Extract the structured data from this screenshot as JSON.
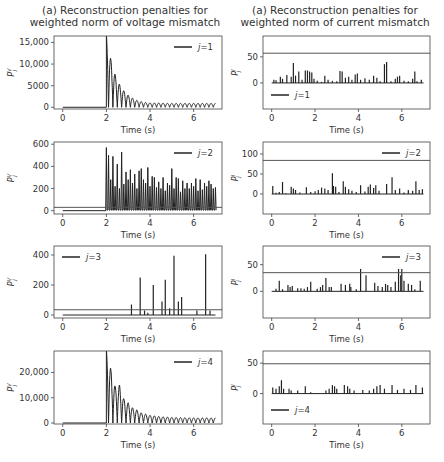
{
  "columns": [
    {
      "title_line1": "(a) Reconstruction penalties for",
      "title_line2": "weighted norm of voltage mismatch"
    },
    {
      "title_line1": "(a) Reconstruction penalties for",
      "title_line2": "weighted norm of current mismatch"
    }
  ],
  "chart_data": [
    {
      "type": "line",
      "panel": "voltage j=1",
      "title": "(a) Reconstruction penalties for weighted norm of voltage mismatch",
      "xlabel": "Time (s)",
      "ylabel": "P^V_j",
      "legend": "j=1",
      "legend_position": "upper right",
      "xlim": [
        -0.4,
        7.3
      ],
      "ylim": [
        -400,
        16500
      ],
      "xticks": [
        0,
        2,
        4,
        6
      ],
      "yticks": [
        0,
        5000,
        10000,
        15000
      ],
      "ytick_labels": [
        "0",
        "5000",
        "10,000",
        "15,000"
      ],
      "threshold": null,
      "description": "zero until t=2, then damped oscillation",
      "envelope": [
        [
          2.0,
          16500
        ],
        [
          2.2,
          11200
        ],
        [
          2.4,
          7600
        ],
        [
          2.6,
          5300
        ],
        [
          2.8,
          3800
        ],
        [
          3.0,
          2800
        ],
        [
          3.2,
          2100
        ],
        [
          3.4,
          1600
        ],
        [
          3.6,
          1300
        ],
        [
          3.8,
          1100
        ],
        [
          4.0,
          1000
        ],
        [
          5.0,
          900
        ],
        [
          6.0,
          900
        ],
        [
          7.0,
          900
        ]
      ]
    },
    {
      "type": "bar",
      "panel": "current j=1",
      "title": "(a) Reconstruction penalties for weighted norm of current mismatch",
      "xlabel": "Time (s)",
      "ylabel": "P^I_j",
      "legend": "j=1",
      "legend_position": "lower left",
      "xlim": [
        -0.4,
        7.3
      ],
      "ylim": [
        -50,
        90
      ],
      "xticks": [
        0,
        2,
        4,
        6
      ],
      "yticks": [
        0,
        50
      ],
      "ytick_labels": [
        "0",
        "50"
      ],
      "threshold": 57,
      "spikes": [
        [
          0.1,
          6
        ],
        [
          0.2,
          5
        ],
        [
          0.4,
          12
        ],
        [
          0.5,
          8
        ],
        [
          0.7,
          15
        ],
        [
          0.9,
          12
        ],
        [
          1.0,
          38
        ],
        [
          1.1,
          14
        ],
        [
          1.25,
          22
        ],
        [
          1.4,
          6
        ],
        [
          1.55,
          24
        ],
        [
          1.65,
          24
        ],
        [
          1.75,
          22
        ],
        [
          1.85,
          20
        ],
        [
          1.95,
          8
        ],
        [
          2.1,
          4
        ],
        [
          2.3,
          2
        ],
        [
          2.45,
          14
        ],
        [
          2.6,
          6
        ],
        [
          2.8,
          4
        ],
        [
          3.0,
          3
        ],
        [
          3.15,
          23
        ],
        [
          3.25,
          22
        ],
        [
          3.4,
          10
        ],
        [
          3.55,
          12
        ],
        [
          3.7,
          6
        ],
        [
          3.85,
          16
        ],
        [
          3.95,
          18
        ],
        [
          4.1,
          6
        ],
        [
          4.3,
          9
        ],
        [
          4.5,
          6
        ],
        [
          4.7,
          14
        ],
        [
          4.85,
          10
        ],
        [
          5.0,
          3
        ],
        [
          5.2,
          36
        ],
        [
          5.3,
          40
        ],
        [
          5.5,
          3
        ],
        [
          5.7,
          8
        ],
        [
          5.8,
          12
        ],
        [
          5.9,
          14
        ],
        [
          6.1,
          4
        ],
        [
          6.3,
          3
        ],
        [
          6.5,
          8
        ],
        [
          6.6,
          22
        ],
        [
          6.7,
          3
        ],
        [
          6.9,
          6
        ]
      ]
    },
    {
      "type": "line",
      "panel": "voltage j=2",
      "xlabel": "Time (s)",
      "ylabel": "P^V_j",
      "legend": "j=2",
      "legend_position": "upper right",
      "xlim": [
        -0.4,
        7.3
      ],
      "ylim": [
        -30,
        620
      ],
      "xticks": [
        0,
        2,
        4,
        6
      ],
      "yticks": [
        0,
        200,
        400,
        600
      ],
      "ytick_labels": [
        "0",
        "200",
        "400",
        "600"
      ],
      "threshold": 30,
      "peaks": [
        [
          2.0,
          570
        ],
        [
          2.1,
          500
        ],
        [
          2.2,
          280
        ],
        [
          2.3,
          490
        ],
        [
          2.4,
          220
        ],
        [
          2.5,
          420
        ],
        [
          2.6,
          200
        ],
        [
          2.7,
          530
        ],
        [
          2.8,
          240
        ],
        [
          2.9,
          350
        ],
        [
          3.0,
          280
        ],
        [
          3.1,
          370
        ],
        [
          3.2,
          250
        ],
        [
          3.3,
          330
        ],
        [
          3.4,
          200
        ],
        [
          3.5,
          360
        ],
        [
          3.6,
          380
        ],
        [
          3.7,
          280
        ],
        [
          3.8,
          250
        ],
        [
          3.9,
          390
        ],
        [
          4.0,
          220
        ],
        [
          4.1,
          310
        ],
        [
          4.2,
          300
        ],
        [
          4.3,
          210
        ],
        [
          4.4,
          260
        ],
        [
          4.5,
          200
        ],
        [
          4.6,
          300
        ],
        [
          4.7,
          180
        ],
        [
          4.8,
          250
        ],
        [
          4.9,
          230
        ],
        [
          5.0,
          380
        ],
        [
          5.1,
          200
        ],
        [
          5.2,
          300
        ],
        [
          5.3,
          290
        ],
        [
          5.4,
          170
        ],
        [
          5.5,
          270
        ],
        [
          5.6,
          200
        ],
        [
          5.7,
          250
        ],
        [
          5.8,
          200
        ],
        [
          5.9,
          250
        ],
        [
          6.0,
          220
        ],
        [
          6.1,
          290
        ],
        [
          6.2,
          180
        ],
        [
          6.3,
          280
        ],
        [
          6.4,
          190
        ],
        [
          6.5,
          250
        ],
        [
          6.6,
          220
        ],
        [
          6.7,
          270
        ],
        [
          6.8,
          240
        ],
        [
          6.9,
          200
        ],
        [
          7.0,
          210
        ]
      ]
    },
    {
      "type": "bar",
      "panel": "current j=2",
      "xlabel": "Time (s)",
      "ylabel": "P^I_j",
      "legend": "j=2",
      "legend_position": "upper right",
      "xlim": [
        -0.4,
        7.3
      ],
      "ylim": [
        -50,
        130
      ],
      "xticks": [
        0,
        2,
        4,
        6
      ],
      "yticks": [
        0,
        50,
        100
      ],
      "ytick_labels": [
        "0",
        "50",
        "100"
      ],
      "threshold": 84,
      "spikes": [
        [
          0.05,
          20
        ],
        [
          0.2,
          3
        ],
        [
          0.35,
          5
        ],
        [
          0.5,
          30
        ],
        [
          0.65,
          2
        ],
        [
          0.9,
          18
        ],
        [
          1.0,
          14
        ],
        [
          1.1,
          10
        ],
        [
          1.3,
          4
        ],
        [
          1.6,
          17
        ],
        [
          1.8,
          5
        ],
        [
          2.0,
          7
        ],
        [
          2.15,
          10
        ],
        [
          2.3,
          16
        ],
        [
          2.45,
          14
        ],
        [
          2.6,
          10
        ],
        [
          2.8,
          52
        ],
        [
          2.85,
          20
        ],
        [
          2.95,
          18
        ],
        [
          3.1,
          5
        ],
        [
          3.3,
          32
        ],
        [
          3.4,
          18
        ],
        [
          3.55,
          12
        ],
        [
          3.7,
          8
        ],
        [
          3.9,
          5
        ],
        [
          4.1,
          22
        ],
        [
          4.3,
          6
        ],
        [
          4.45,
          18
        ],
        [
          4.55,
          24
        ],
        [
          4.7,
          15
        ],
        [
          4.8,
          22
        ],
        [
          4.95,
          8
        ],
        [
          5.3,
          25
        ],
        [
          5.55,
          42
        ],
        [
          5.7,
          10
        ],
        [
          5.9,
          14
        ],
        [
          6.1,
          4
        ],
        [
          6.3,
          10
        ],
        [
          6.5,
          8
        ],
        [
          6.65,
          32
        ],
        [
          6.8,
          10
        ],
        [
          6.95,
          12
        ]
      ]
    },
    {
      "type": "bar",
      "panel": "voltage j=3",
      "xlabel": "Time (s)",
      "ylabel": "P^V_j",
      "legend": "j=3",
      "legend_position": "upper left",
      "xlim": [
        -0.4,
        7.3
      ],
      "ylim": [
        -20,
        460
      ],
      "xticks": [
        0,
        2,
        4,
        6
      ],
      "yticks": [
        0,
        200,
        400
      ],
      "ytick_labels": [
        "0",
        "200",
        "400"
      ],
      "threshold": 35,
      "spikes": [
        [
          3.15,
          70
        ],
        [
          3.55,
          250
        ],
        [
          3.75,
          30
        ],
        [
          3.9,
          15
        ],
        [
          4.15,
          200
        ],
        [
          4.55,
          90
        ],
        [
          4.7,
          235
        ],
        [
          4.9,
          45
        ],
        [
          5.1,
          395
        ],
        [
          5.3,
          90
        ],
        [
          5.45,
          120
        ],
        [
          6.15,
          30
        ],
        [
          6.55,
          405
        ],
        [
          6.75,
          30
        ]
      ]
    },
    {
      "type": "bar",
      "panel": "current j=3",
      "xlabel": "Time (s)",
      "ylabel": "P^I_j",
      "legend": "j=3",
      "legend_position": "upper right",
      "xlim": [
        -0.4,
        7.3
      ],
      "ylim": [
        -50,
        85
      ],
      "xticks": [
        0,
        2,
        4,
        6
      ],
      "yticks": [
        0,
        50
      ],
      "ytick_labels": [
        "0",
        "50"
      ],
      "threshold": 35,
      "spikes": [
        [
          0.2,
          5
        ],
        [
          0.35,
          20
        ],
        [
          0.5,
          4
        ],
        [
          0.75,
          12
        ],
        [
          0.85,
          8
        ],
        [
          0.95,
          10
        ],
        [
          1.2,
          6
        ],
        [
          1.35,
          6
        ],
        [
          1.5,
          5
        ],
        [
          1.65,
          8
        ],
        [
          1.8,
          18
        ],
        [
          2.1,
          5
        ],
        [
          2.25,
          8
        ],
        [
          2.35,
          12
        ],
        [
          2.5,
          25
        ],
        [
          2.65,
          8
        ],
        [
          2.75,
          8
        ],
        [
          3.2,
          14
        ],
        [
          3.4,
          12
        ],
        [
          3.6,
          14
        ],
        [
          3.65,
          8
        ],
        [
          3.9,
          4
        ],
        [
          4.1,
          42
        ],
        [
          4.35,
          30
        ],
        [
          4.75,
          16
        ],
        [
          4.9,
          10
        ],
        [
          5.1,
          8
        ],
        [
          5.25,
          14
        ],
        [
          5.35,
          12
        ],
        [
          5.5,
          8
        ],
        [
          5.7,
          18
        ],
        [
          5.85,
          42
        ],
        [
          5.95,
          30
        ],
        [
          6.0,
          42
        ],
        [
          6.1,
          20
        ],
        [
          6.3,
          14
        ],
        [
          6.45,
          12
        ],
        [
          6.6,
          4
        ],
        [
          6.85,
          20
        ]
      ]
    },
    {
      "type": "line",
      "panel": "voltage j=4",
      "xlabel": "Time (s)",
      "ylabel": "P^V_j",
      "legend": "j=4",
      "legend_position": "upper right",
      "xlim": [
        -0.4,
        7.3
      ],
      "ylim": [
        -400,
        28500
      ],
      "xticks": [
        0,
        2,
        4,
        6
      ],
      "yticks": [
        0,
        10000,
        20000
      ],
      "ytick_labels": [
        "0",
        "10,000",
        "20,000"
      ],
      "threshold": null,
      "description": "zero until t=2, then damped oscillation",
      "envelope": [
        [
          2.0,
          28500
        ],
        [
          2.1,
          26000
        ],
        [
          2.2,
          21500
        ],
        [
          2.4,
          14500
        ],
        [
          2.6,
          15000
        ],
        [
          2.8,
          9500
        ],
        [
          3.0,
          8000
        ],
        [
          3.2,
          6000
        ],
        [
          3.4,
          5200
        ],
        [
          3.6,
          4000
        ],
        [
          3.8,
          3500
        ],
        [
          4.0,
          3000
        ],
        [
          4.5,
          2500
        ],
        [
          5.0,
          2200
        ],
        [
          6.0,
          2000
        ],
        [
          7.0,
          2000
        ]
      ]
    },
    {
      "type": "bar",
      "panel": "current j=4",
      "xlabel": "Time (s)",
      "ylabel": "P^I_j",
      "legend": "j=4",
      "legend_position": "lower left",
      "xlim": [
        -0.4,
        7.3
      ],
      "ylim": [
        -50,
        70
      ],
      "xticks": [
        0,
        2,
        4,
        6
      ],
      "yticks": [
        0,
        50
      ],
      "ytick_labels": [
        "0",
        "50"
      ],
      "threshold": 49,
      "spikes": [
        [
          0.05,
          10
        ],
        [
          0.2,
          8
        ],
        [
          0.35,
          12
        ],
        [
          0.45,
          22
        ],
        [
          0.55,
          8
        ],
        [
          0.8,
          8
        ],
        [
          0.9,
          5
        ],
        [
          1.2,
          5
        ],
        [
          1.55,
          12
        ],
        [
          1.8,
          2
        ],
        [
          2.5,
          5
        ],
        [
          2.65,
          8
        ],
        [
          2.8,
          14
        ],
        [
          2.9,
          12
        ],
        [
          3.0,
          8
        ],
        [
          3.35,
          14
        ],
        [
          3.5,
          12
        ],
        [
          3.6,
          8
        ],
        [
          3.8,
          5
        ],
        [
          4.2,
          6
        ],
        [
          4.5,
          5
        ],
        [
          4.7,
          8
        ],
        [
          4.85,
          12
        ],
        [
          5.0,
          14
        ],
        [
          5.2,
          8
        ],
        [
          5.55,
          14
        ],
        [
          5.8,
          6
        ],
        [
          6.1,
          8
        ],
        [
          6.4,
          6
        ],
        [
          6.65,
          14
        ],
        [
          6.95,
          10
        ]
      ]
    }
  ]
}
